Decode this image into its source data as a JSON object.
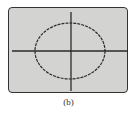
{
  "figure": {
    "caption": "(b)",
    "colors": {
      "screen": "#d3d3d1",
      "trace": "#2a2a2a",
      "frame": "#333333"
    },
    "trace": {
      "shape": "ellipse",
      "style": "dashed",
      "center": "origin",
      "aspect_ratio_x_to_y": 1.25
    }
  }
}
